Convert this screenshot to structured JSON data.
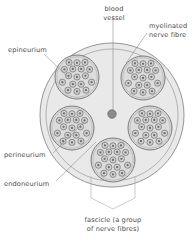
{
  "diagram": {
    "background_color": "#ffffff",
    "labels": {
      "blood_vessel_line1": "blood",
      "blood_vessel_line2": "vessel",
      "myelinated_line1": "myelinated",
      "myelinated_line2": "nerve fibre",
      "epineurium": "epineurium",
      "perineurium": "perineurium",
      "endoneurium": "endoneurium",
      "fascicle_line1": "fascicle (a group",
      "fascicle_line2": "of nerve fibres)"
    },
    "colors": {
      "text": "#4a4a4a",
      "leader_line": "#8f8f8f",
      "bracket": "#b5b5b5",
      "epineurium_fill": "#e9e9e9",
      "epineurium_stroke": "#8a8a8a",
      "perineurium_stroke": "#9a9a9a",
      "fascicle_fill": "#dcdcdc",
      "fascicle_stroke": "#6f6f6f",
      "fibre_fill": "#d2d2d2",
      "fibre_stroke": "#6b6b6b",
      "axon_fill": "#6e6e6e",
      "blood_vessel_fill": "#8c8c8c",
      "blood_vessel_stroke": "#5e5e5e"
    },
    "geometry": {
      "epineurium_center_x": 112,
      "epineurium_center_y": 115,
      "epineurium_radius": 72,
      "perineurium_radius": 66,
      "blood_vessel_x": 112,
      "blood_vessel_y": 114,
      "blood_vessel_radius": 4.2,
      "fascicle_radius": 22,
      "fibre_radius": 3.1,
      "axon_radius": 1.15
    },
    "fascicles": [
      {
        "name": "fascicle-top-left",
        "cx": 77,
        "cy": 77
      },
      {
        "name": "fascicle-top-right",
        "cx": 143,
        "cy": 78
      },
      {
        "name": "fascicle-left",
        "cx": 72,
        "cy": 128
      },
      {
        "name": "fascicle-right",
        "cx": 150,
        "cy": 128
      },
      {
        "name": "fascicle-bottom",
        "cx": 113,
        "cy": 160
      }
    ],
    "fibre_offsets": [
      {
        "dx": 0,
        "dy": 0
      },
      {
        "dx": -8.4,
        "dy": -1.2
      },
      {
        "dx": 8.4,
        "dy": -1.2
      },
      {
        "dx": -4.2,
        "dy": -8.0
      },
      {
        "dx": 4.2,
        "dy": -8.0
      },
      {
        "dx": -4.2,
        "dy": 7.2
      },
      {
        "dx": 4.2,
        "dy": 7.2
      },
      {
        "dx": -12.6,
        "dy": -7.6
      },
      {
        "dx": 0,
        "dy": -14.2
      },
      {
        "dx": 12.6,
        "dy": -7.6
      },
      {
        "dx": -14.6,
        "dy": 5.2
      },
      {
        "dx": 14.6,
        "dy": 5.2
      },
      {
        "dx": -9.0,
        "dy": 13.2
      },
      {
        "dx": 0,
        "dy": 14.4
      },
      {
        "dx": 9.0,
        "dy": 13.2
      },
      {
        "dx": -8.0,
        "dy": -14.6
      },
      {
        "dx": 8.0,
        "dy": -14.6
      }
    ],
    "label_positions": {
      "blood_vessel": {
        "x": 114,
        "y": 11,
        "line_gap": 9
      },
      "myelinated": {
        "x": 149,
        "y": 28,
        "line_gap": 9
      },
      "epineurium": {
        "x": 8,
        "y": 52
      },
      "perineurium": {
        "x": 4,
        "y": 157
      },
      "endoneurium": {
        "x": 4,
        "y": 186
      },
      "fascicle": {
        "x": 113,
        "y": 222,
        "line_gap": 9
      }
    },
    "leader_lines": [
      {
        "name": "leader-blood-vessel",
        "points": "113,17 113,110"
      },
      {
        "name": "leader-myelinated",
        "points": "147,33 126,63"
      },
      {
        "name": "leader-epineurium",
        "points": "44,54 70,79"
      },
      {
        "name": "leader-perineurium",
        "points": "53,153 86,120"
      },
      {
        "name": "leader-endoneurium",
        "points": "56,181 96,142"
      }
    ],
    "bracket_path": "M 91,176 L 91,198 L 113,209 L 135,198 L 135,176"
  }
}
